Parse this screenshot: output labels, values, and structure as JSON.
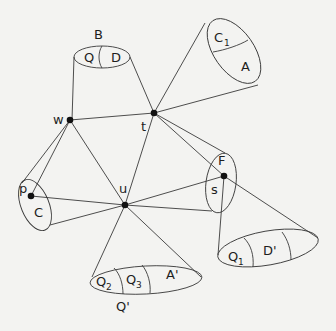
{
  "diagram": {
    "type": "graph-with-cones",
    "nodes": [
      {
        "id": "w",
        "label": "w",
        "x": 70,
        "y": 120
      },
      {
        "id": "t",
        "label": "t",
        "x": 154,
        "y": 113
      },
      {
        "id": "u",
        "label": "u",
        "x": 125,
        "y": 205
      },
      {
        "id": "s",
        "label": "s",
        "x": 224,
        "y": 176
      },
      {
        "id": "p",
        "label": "p",
        "x": 31,
        "y": 196
      }
    ],
    "edges": [
      {
        "from": "w",
        "to": "t"
      },
      {
        "from": "w",
        "to": "u"
      },
      {
        "from": "w",
        "to": "p"
      },
      {
        "from": "t",
        "to": "u"
      },
      {
        "from": "t",
        "to": "s"
      },
      {
        "from": "u",
        "to": "s"
      },
      {
        "from": "u",
        "to": "p"
      }
    ],
    "cones": [
      {
        "id": "B",
        "label": "B",
        "apex": [
          "w",
          "t"
        ],
        "parts": [
          "Q",
          "D"
        ]
      },
      {
        "id": "C1A",
        "apex": "t",
        "parts": [
          "C",
          "A"
        ],
        "part_subscripts": [
          "1",
          ""
        ]
      },
      {
        "id": "F",
        "apex": "t",
        "parts": [
          "F",
          "s"
        ]
      },
      {
        "id": "C",
        "apex": "w",
        "parts": [
          "p",
          "C"
        ]
      },
      {
        "id": "Q'",
        "label": "Q'",
        "apex": "u",
        "parts": [
          "Q",
          "Q",
          "A'"
        ],
        "part_subscripts": [
          "2",
          "3",
          ""
        ]
      },
      {
        "id": "D'",
        "apex": "s",
        "parts": [
          "Q",
          "D'",
          ""
        ],
        "part_subscripts": [
          "1",
          "",
          ""
        ]
      }
    ],
    "labels": {
      "B": "B",
      "Q": "Q",
      "D": "D",
      "C": "C",
      "sub1": "1",
      "sub2": "2",
      "sub3": "3",
      "A": "A",
      "w": "w",
      "t": "t",
      "F": "F",
      "s": "s",
      "p": "p",
      "u": "u",
      "Cbig": "C",
      "A_prime": "A'",
      "Q_prime": "Q'",
      "D_prime": "D'"
    }
  }
}
